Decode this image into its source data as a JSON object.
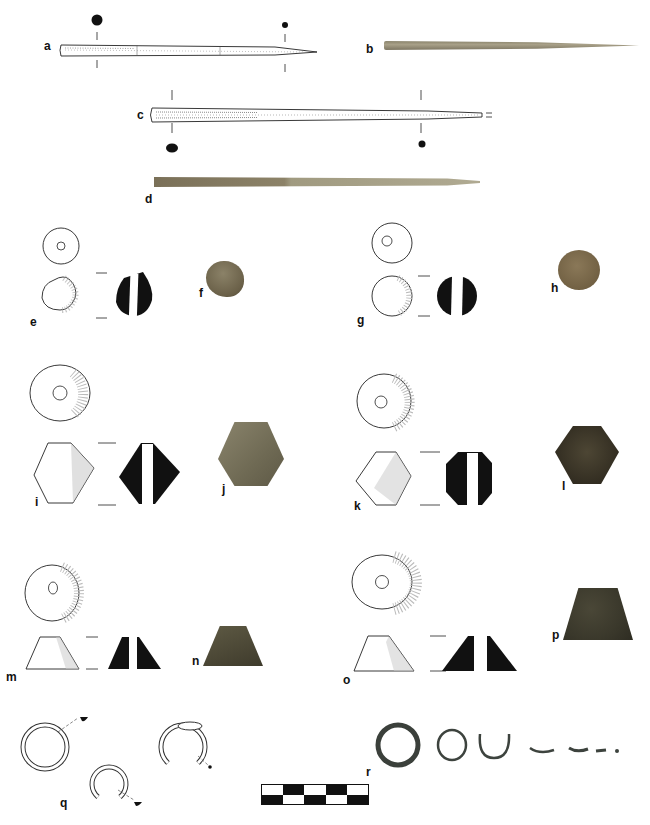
{
  "figure": {
    "type": "archaeological finds plate",
    "labels": {
      "a": "a",
      "b": "b",
      "c": "c",
      "d": "d",
      "e": "e",
      "f": "f",
      "g": "g",
      "h": "h",
      "i": "i",
      "j": "j",
      "k": "k",
      "l": "l",
      "m": "m",
      "n": "n",
      "o": "o",
      "p": "p",
      "q": "q",
      "r": "r"
    },
    "items": [
      {
        "id": "a",
        "kind": "drawing",
        "object": "bone pin, profile with cross-sections"
      },
      {
        "id": "b",
        "kind": "photo",
        "object": "bone pin"
      },
      {
        "id": "c",
        "kind": "drawing",
        "object": "bone pin, profile with cross-sections"
      },
      {
        "id": "d",
        "kind": "photo",
        "object": "bone pin"
      },
      {
        "id": "e",
        "kind": "drawing",
        "object": "spherical spindle whorl, plan/elevation/section"
      },
      {
        "id": "f",
        "kind": "photo",
        "object": "spherical spindle whorl"
      },
      {
        "id": "g",
        "kind": "drawing",
        "object": "spherical spindle whorl, plan/elevation/section"
      },
      {
        "id": "h",
        "kind": "photo",
        "object": "spherical spindle whorl"
      },
      {
        "id": "i",
        "kind": "drawing",
        "object": "biconical spindle whorl, plan/elevation/section"
      },
      {
        "id": "j",
        "kind": "photo",
        "object": "biconical spindle whorl"
      },
      {
        "id": "k",
        "kind": "drawing",
        "object": "biconical spindle whorl, plan/elevation/section"
      },
      {
        "id": "l",
        "kind": "photo",
        "object": "biconical spindle whorl"
      },
      {
        "id": "m",
        "kind": "drawing",
        "object": "conical spindle whorl, plan/elevation/section"
      },
      {
        "id": "n",
        "kind": "photo",
        "object": "conical spindle whorl"
      },
      {
        "id": "o",
        "kind": "drawing",
        "object": "conical spindle whorl, plan/elevation/section"
      },
      {
        "id": "p",
        "kind": "photo",
        "object": "conical spindle whorl"
      },
      {
        "id": "q",
        "kind": "drawing",
        "object": "metal rings"
      },
      {
        "id": "r",
        "kind": "photo",
        "object": "metal rings and fragments"
      }
    ],
    "scale_bar": {
      "segments": 5,
      "rows": 2
    },
    "colors": {
      "bone_light": "#a89f86",
      "bone_dark": "#7d7560",
      "whorl_f": "#6f6650",
      "whorl_h": "#7a6a4e",
      "whorl_j": "#77735e",
      "whorl_l": "#3a3426",
      "whorl_n": "#4b4836",
      "whorl_p": "#3b3a2c",
      "ring_metal": "#3d433e"
    }
  }
}
